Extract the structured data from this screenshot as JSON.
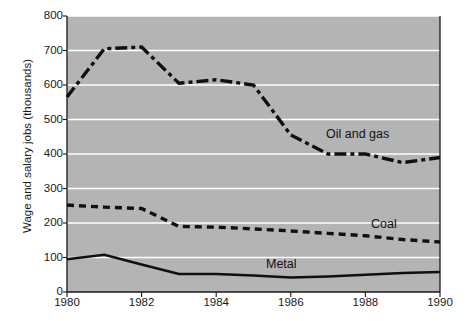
{
  "chart_data": {
    "type": "line",
    "title": "",
    "xlabel": "",
    "ylabel": "Wage and salary jobs (thousands)",
    "xlim": [
      1980,
      1990
    ],
    "ylim": [
      0,
      800
    ],
    "grid": true,
    "legend_position": "inline-on-lines",
    "plot_background": "#b4b4b4",
    "gridline_color": "#ffffff",
    "line_color": "#101010",
    "y_ticks": [
      800,
      700,
      600,
      500,
      400,
      300,
      200,
      100,
      0
    ],
    "x_ticks": [
      1980,
      1982,
      1984,
      1986,
      1988,
      1990
    ],
    "x": [
      1980,
      1981,
      1982,
      1983,
      1984,
      1985,
      1986,
      1987,
      1988,
      1989,
      1990
    ],
    "series": [
      {
        "name": "Oil and gas",
        "style": "dash-dot",
        "values": [
          565,
          705,
          710,
          605,
          615,
          600,
          455,
          400,
          400,
          375,
          390
        ]
      },
      {
        "name": "Coal",
        "style": "dashed",
        "values": [
          252,
          246,
          242,
          190,
          188,
          183,
          177,
          170,
          163,
          152,
          145
        ]
      },
      {
        "name": "Metal",
        "style": "solid",
        "values": [
          95,
          108,
          80,
          52,
          52,
          48,
          42,
          45,
          50,
          55,
          58
        ]
      }
    ]
  },
  "axis": {
    "y_title": "Wage and salary jobs (thousands)",
    "y_tick_labels": [
      "800",
      "700",
      "600",
      "500",
      "400",
      "300",
      "200",
      "100",
      "0"
    ],
    "x_tick_labels": [
      "1980",
      "1982",
      "1984",
      "1986",
      "1988",
      "1990"
    ]
  },
  "labels": {
    "oil_and_gas": "Oil and gas",
    "coal": "Coal",
    "metal": "Metal"
  }
}
